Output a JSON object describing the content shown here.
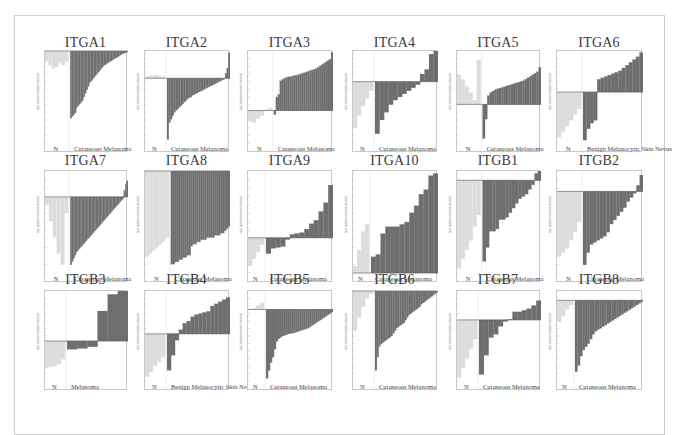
{
  "figure": {
    "layout": {
      "rows": 3,
      "cols": 6
    },
    "colors": {
      "normal_bars": "#dcdcdc",
      "tumor_bars": "#6e6e6e",
      "axis": "#bdbdbd",
      "baseline": "#555555",
      "title": "#3a3a3a"
    }
  },
  "chart_data": [
    {
      "type": "bar",
      "title": "ITGA1",
      "group_left": "N",
      "group_right": "Cutaneous Melanoma",
      "ylabel": "log2 median-centered intensity",
      "baseline_frac": 0.0,
      "normal": [
        -0.3,
        -0.4,
        -0.5,
        -0.45,
        -0.35,
        -0.4,
        -0.3
      ],
      "tumor": [
        -1.9,
        -1.85,
        -1.8,
        -1.75,
        -1.6,
        -1.55,
        -1.5,
        -1.45,
        -1.4,
        -1.3,
        -1.2,
        -1.1,
        -1.0,
        -0.9,
        -0.85,
        -0.8,
        -0.75,
        -0.7,
        -0.65,
        -0.6,
        -0.55,
        -0.5,
        -0.45,
        -0.4,
        -0.38,
        -0.35,
        -0.32,
        -0.3,
        -0.28,
        -0.25,
        -0.22,
        -0.2,
        -0.18,
        -0.15,
        -0.12,
        -0.1,
        -0.08,
        -0.06,
        -0.05,
        -0.03
      ],
      "ylim": [
        -2.6,
        0
      ]
    },
    {
      "type": "bar",
      "title": "ITGA2",
      "group_left": "N",
      "group_right": "Cutaneous Melanoma",
      "ylabel": "log2 median-centered intensity",
      "normal": [
        0.1,
        0.15,
        0.2,
        0.15,
        0.1
      ],
      "tumor": [
        -3.6,
        -2.6,
        -2.4,
        -2.2,
        -2.0,
        -1.9,
        -1.8,
        -1.7,
        -1.6,
        -1.5,
        -1.4,
        -1.3,
        -1.2,
        -1.15,
        -1.1,
        -1.0,
        -0.95,
        -0.9,
        -0.85,
        -0.8,
        -0.75,
        -0.7,
        -0.65,
        -0.6,
        -0.55,
        -0.5,
        -0.45,
        -0.4,
        -0.35,
        -0.3,
        -0.25,
        -0.2,
        -0.15,
        -0.1,
        -0.05,
        0.3,
        0.6,
        1.5
      ],
      "ylim": [
        -3.8,
        1.6
      ]
    },
    {
      "type": "bar",
      "title": "ITGA3",
      "group_left": "N",
      "group_right": "Cutaneous Melanoma",
      "ylabel": "log2 median-centered intensity",
      "normal": [
        -0.8,
        -0.9,
        -0.6,
        -0.4,
        0.1,
        0.2
      ],
      "tumor": [
        -0.3,
        1.0,
        1.2,
        2.2,
        2.3,
        2.4,
        2.45,
        2.5,
        2.5,
        2.55,
        2.6,
        2.6,
        2.65,
        2.7,
        2.75,
        2.8,
        2.85,
        2.9,
        2.95,
        3.0,
        3.05,
        3.1,
        3.2,
        3.3,
        3.4,
        3.5,
        3.6,
        3.7,
        3.8,
        4.3
      ],
      "ylim": [
        -2.4,
        4.4
      ]
    },
    {
      "type": "bar",
      "title": "ITGA4",
      "group_left": "N",
      "group_right": "Cutaneous Melanoma",
      "ylabel": "log2 median-centered intensity",
      "normal": [
        -3.0,
        -2.2,
        -1.6,
        -1.1,
        -0.6
      ],
      "tumor": [
        -3.4,
        -2.5,
        -2.0,
        -1.5,
        -1.2,
        -1.0,
        -0.8,
        -0.6,
        -0.4,
        -0.2,
        0.5,
        0.8,
        1.8,
        2.0
      ],
      "ylim": [
        -4.0,
        2.0
      ]
    },
    {
      "type": "bar",
      "title": "ITGA5",
      "group_left": "N",
      "group_right": "Cutaneous Melanoma",
      "ylabel": "log2 median-centered intensity",
      "normal": [
        2.0,
        1.7,
        1.2,
        0.8,
        0.3,
        3.0
      ],
      "tumor": [
        -2.3,
        -1.0,
        0.6,
        0.8,
        0.9,
        1.0,
        1.05,
        1.1,
        1.15,
        1.2,
        1.25,
        1.3,
        1.35,
        1.4,
        1.45,
        1.5,
        1.55,
        1.6,
        1.7,
        1.8,
        1.9,
        2.0,
        2.1,
        2.2,
        2.5
      ],
      "ylim": [
        -2.6,
        3.6
      ]
    },
    {
      "type": "bar",
      "title": "ITGA6",
      "group_left": "N",
      "group_right": "Benign Melanocytic Skin Nevus",
      "ylabel": "log2 median-centered intensity",
      "normal": [
        -3.2,
        -2.8,
        -2.4,
        -2.0,
        -1.6,
        -1.2
      ],
      "tumor": [
        -3.4,
        -2.6,
        -2.2,
        -2.0,
        0.9,
        1.0,
        1.1,
        1.2,
        1.3,
        1.4,
        1.5,
        1.7,
        1.9,
        2.1,
        2.3,
        2.5,
        2.8
      ],
      "ylim": [
        -3.6,
        2.9
      ]
    },
    {
      "type": "bar",
      "title": "ITGA7",
      "group_left": "N",
      "group_right": "Cutaneous Melanoma",
      "ylabel": "log2 median-centered intensity",
      "normal": [
        -0.5,
        -1.5,
        -2.5,
        -3.5,
        -4.2,
        -1.0
      ],
      "tumor": [
        -4.2,
        -4.0,
        -3.8,
        -3.6,
        -3.4,
        -3.3,
        -3.2,
        -3.1,
        -3.0,
        -2.9,
        -2.8,
        -2.7,
        -2.6,
        -2.5,
        -2.4,
        -2.3,
        -2.2,
        -2.1,
        -2.0,
        -1.9,
        -1.8,
        -1.7,
        -1.6,
        -1.5,
        -1.4,
        -1.3,
        -1.2,
        -1.1,
        -1.0,
        -0.9,
        -0.8,
        -0.7,
        -0.6,
        -0.5,
        -0.4,
        -0.3,
        -0.2,
        -0.1,
        0.4,
        0.8,
        1.0
      ],
      "ylim": [
        -4.7,
        1.6
      ]
    },
    {
      "type": "bar",
      "title": "ITGA8",
      "group_left": "N",
      "group_right": "Cutaneous Melanoma",
      "ylabel": "log2 median-centered intensity",
      "normal": [
        -3.9,
        -3.8,
        -3.7,
        -3.6,
        -3.5,
        -3.4,
        -3.3,
        -3.2,
        -3.1,
        -3.0
      ],
      "tumor": [
        -4.2,
        -4.2,
        -4.1,
        -4.1,
        -4.0,
        -4.0,
        -3.9,
        -3.9,
        -3.8,
        -3.8,
        -3.4,
        -3.3,
        -3.3,
        -3.2,
        -3.2,
        -3.1,
        -3.1,
        -3.1,
        -3.0,
        -3.0,
        -3.0,
        -3.0,
        -2.9,
        -2.9,
        -2.9,
        -2.8,
        -2.8,
        -2.7,
        -2.6,
        -2.5
      ],
      "ylim": [
        -4.6,
        0
      ]
    },
    {
      "type": "bar",
      "title": "ITGA9",
      "group_left": "N",
      "group_right": "Cutaneous Melanoma",
      "ylabel": "log2 median-centered intensity",
      "normal": [
        -1.6,
        -1.2,
        -0.8,
        -0.4
      ],
      "tumor": [
        -0.9,
        -0.6,
        -0.55,
        -0.5,
        -0.1,
        0.2,
        0.25,
        0.3,
        0.5,
        0.8,
        1.0,
        1.5,
        2.0,
        3.0
      ],
      "ylim": [
        -2.0,
        3.8
      ]
    },
    {
      "type": "bar",
      "title": "ITGA10",
      "group_left": "N",
      "group_right": "Cutaneous Melanoma",
      "ylabel": "log2 median-centered intensity",
      "normal": [
        0.3,
        1.0,
        1.8,
        2.1
      ],
      "tumor": [
        0.7,
        0.8,
        1.7,
        2.0,
        2.0,
        2.0,
        2.1,
        2.2,
        2.6,
        2.9,
        3.4,
        3.6,
        4.2,
        4.3
      ],
      "ylim": [
        0,
        4.4
      ]
    },
    {
      "type": "bar",
      "title": "ITGB1",
      "group_left": "N",
      "group_right": "Cutaneous Melanoma",
      "ylabel": "log2 median-centered intensity",
      "normal": [
        -3.8,
        -3.4,
        -3.0,
        -2.6,
        -2.0,
        -1.5
      ],
      "tumor": [
        -3.5,
        -2.9,
        -2.2,
        -2.2,
        -2.1,
        -1.7,
        -1.7,
        -1.6,
        -1.4,
        -1.2,
        -1.0,
        -0.8,
        -0.7,
        -0.6,
        -0.4,
        -0.2,
        0.3,
        0.4
      ],
      "ylim": [
        -4.0,
        0.4
      ]
    },
    {
      "type": "bar",
      "title": "ITGB2",
      "group_left": "N",
      "group_right": "Cutaneous Melanoma",
      "ylabel": "log2 median-centered intensity",
      "normal": [
        -3.2,
        -3.0,
        -2.8,
        -2.4,
        -2.0,
        -1.5
      ],
      "tumor": [
        -3.6,
        -3.0,
        -2.6,
        -2.5,
        -2.4,
        -2.3,
        -2.2,
        -2.0,
        -1.6,
        -1.4,
        -1.2,
        -1.0,
        -0.8,
        -0.5,
        -0.3,
        -0.1,
        0.3,
        0.8
      ],
      "ylim": [
        -4.0,
        1.0
      ]
    },
    {
      "type": "bar",
      "title": "ITGB3",
      "group_left": "N",
      "group_right": "Melanoma",
      "ylabel": "log2 median-centered intensity",
      "normal": [
        -1.6,
        -1.55,
        -1.5,
        -1.4,
        -1.1
      ],
      "tumor": [
        -0.5,
        -0.45,
        -0.35,
        1.8,
        2.8,
        3.0
      ],
      "ylim": [
        -2.4,
        3.0
      ]
    },
    {
      "type": "bar",
      "title": "ITGB4",
      "group_left": "N",
      "group_right": "Benign Melanocytic Skin Nevus",
      "ylabel": "log2 median-centered intensity",
      "normal": [
        -2.0,
        -1.8,
        -1.5,
        -1.3,
        -1.1
      ],
      "tumor": [
        -1.7,
        -1.0,
        -0.3,
        0.2,
        0.5,
        0.6,
        0.8,
        0.9,
        0.95,
        1.0,
        1.05,
        1.3,
        1.4,
        1.5,
        1.6,
        1.7
      ],
      "ylim": [
        -2.2,
        2.0
      ]
    },
    {
      "type": "bar",
      "title": "ITGB5",
      "group_left": "N",
      "group_right": "Cutaneous Melanoma",
      "ylabel": "log2 median-centered intensity",
      "normal": [
        0.05,
        0.1,
        0.3,
        0.5
      ],
      "tumor": [
        -5.2,
        -4.6,
        -4.0,
        -3.6,
        -3.0,
        -2.4,
        -2.2,
        -2.1,
        -2.0,
        -1.95,
        -1.9,
        -1.85,
        -1.8,
        -1.8,
        -1.75,
        -1.7,
        -1.65,
        -1.6,
        -1.55,
        -1.5,
        -1.45,
        -1.4,
        -1.3,
        -1.2,
        -1.1,
        -1.0,
        -0.9,
        -0.8,
        -0.7,
        -0.6,
        -0.5,
        -0.4,
        -0.3,
        -0.2
      ],
      "ylim": [
        -5.4,
        1.4
      ]
    },
    {
      "type": "bar",
      "title": "ITGB6",
      "group_left": "N",
      "group_right": "Cutaneous Melanoma",
      "ylabel": "log2 median-centered intensity",
      "normal": [
        -3.0,
        -2.0,
        -1.2,
        -0.6,
        -0.2
      ],
      "tumor": [
        -6.0,
        -5.0,
        -4.2,
        -4.0,
        -3.9,
        -3.8,
        -3.7,
        -3.6,
        -3.5,
        -3.4,
        -3.2,
        -3.0,
        -2.8,
        -2.7,
        -2.6,
        -2.5,
        -2.4,
        -2.2,
        -2.0,
        -1.8,
        -1.7,
        -1.6,
        -1.5,
        -1.4,
        -1.3,
        -1.2,
        -1.0,
        -0.9,
        -0.8,
        -0.7,
        -0.6,
        -0.5,
        -0.4,
        -0.3,
        -0.2,
        -0.1
      ],
      "ylim": [
        -6.8,
        0
      ]
    },
    {
      "type": "bar",
      "title": "ITGB7",
      "group_left": "N",
      "group_right": "Cutaneous Melanoma",
      "ylabel": "log2 median-centered intensity",
      "normal": [
        -3.6,
        -3.0,
        -2.4,
        -1.8,
        -1.2
      ],
      "tumor": [
        -3.4,
        -2.2,
        -1.1,
        -0.9,
        -0.4,
        -0.1,
        0.05,
        0.5,
        0.5,
        0.6,
        0.7,
        0.9,
        1.2
      ],
      "ylim": [
        -3.8,
        1.8
      ]
    },
    {
      "type": "bar",
      "title": "ITGB8",
      "group_left": "N",
      "group_right": "Cutaneous Melanoma",
      "ylabel": "log2 median-centered intensity",
      "normal": [
        -1.4,
        -1.0,
        -0.6,
        -0.3
      ],
      "tumor": [
        -4.6,
        -4.2,
        -3.6,
        -3.2,
        -3.0,
        -2.8,
        -2.5,
        -2.2,
        -2.0,
        -1.9,
        -1.8,
        -1.7,
        -1.6,
        -1.5,
        -1.4,
        -1.3,
        -1.2,
        -1.1,
        -1.0,
        -0.9,
        -0.8,
        -0.7,
        -0.6,
        -0.5,
        -0.4,
        -0.3,
        -0.2,
        -0.1
      ],
      "ylim": [
        -5.2,
        0.6
      ]
    }
  ]
}
